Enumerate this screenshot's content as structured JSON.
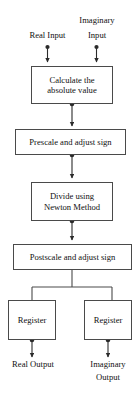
{
  "diagram": {
    "stroke_color": "#4a4a4a",
    "text_color": "#111111",
    "background_color": "#ffffff",
    "inputs": [
      {
        "id": "real-input",
        "label": "Real Input"
      },
      {
        "id": "imaginary-input",
        "label": "Imaginary\nInput",
        "line1": "Imaginary",
        "line2": "Input"
      }
    ],
    "steps": [
      {
        "id": "calculate-absolute-value",
        "line1": "Calculate the",
        "line2": "absolute value"
      },
      {
        "id": "prescale-adjust-sign",
        "line1": "Prescale and adjust sign",
        "line2": ""
      },
      {
        "id": "divide-newton-method",
        "line1": "Divide using",
        "line2": "Newton Method"
      },
      {
        "id": "postscale-adjust-sign",
        "line1": "Postscale and adjust sign",
        "line2": ""
      }
    ],
    "registers": [
      {
        "id": "register-real",
        "label": "Register"
      },
      {
        "id": "register-imaginary",
        "label": "Register"
      }
    ],
    "outputs": [
      {
        "id": "real-output",
        "label": "Real Output",
        "line1": "Real Output",
        "line2": ""
      },
      {
        "id": "imaginary-output",
        "label": "Imaginary Output",
        "line1": "Imaginary",
        "line2": "Output"
      }
    ]
  }
}
